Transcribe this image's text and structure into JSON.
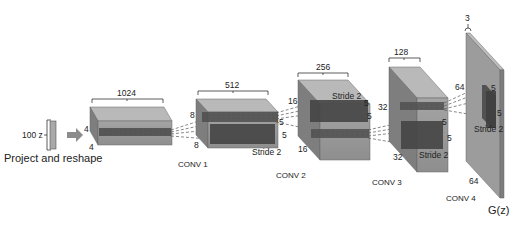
{
  "input": {
    "label": "100 z",
    "caption": "Project and reshape"
  },
  "colors": {
    "block_front": "#9a9a9a",
    "block_top": "#b8b8b8",
    "block_side": "#7c7c7c",
    "kernel": "#555555",
    "kernel_dark": "#3f3f3f",
    "input_bar": "#a9a9a9",
    "arrow": "#8c8c8c"
  },
  "layers": [
    {
      "name": "project",
      "width_label": "1024",
      "h_label": "4",
      "d_label": "4",
      "caption": ""
    },
    {
      "name": "conv1",
      "width_label": "512",
      "h_label": "8",
      "d_label": "8",
      "kernel_a": "5",
      "kernel_b": "5",
      "stride": "Stride 2",
      "caption": "CONV 1"
    },
    {
      "name": "conv2",
      "width_label": "256",
      "h_label": "16",
      "d_label": "16",
      "kernel_a": "5",
      "kernel_b": "5",
      "stride": "Stride 2",
      "caption": "CONV 2"
    },
    {
      "name": "conv3",
      "width_label": "128",
      "h_label": "32",
      "d_label": "32",
      "kernel_a": "5",
      "kernel_b": "5",
      "stride": "Stride 2",
      "caption": "CONV 3"
    },
    {
      "name": "conv4",
      "width_label": "3",
      "h_label": "64",
      "d_label": "64",
      "kernel_a": "5",
      "kernel_b": "5",
      "stride": "Stride 2",
      "caption": "CONV 4"
    }
  ],
  "output": {
    "label": "G(z)"
  }
}
